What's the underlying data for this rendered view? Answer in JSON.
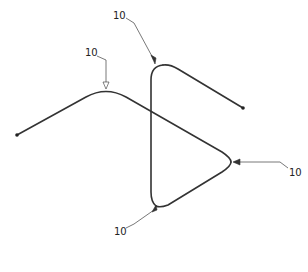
{
  "diagram": {
    "type": "patent line drawing",
    "colors": {
      "stroke": "#333333",
      "leader": "#555555",
      "background": "#ffffff"
    },
    "reference_labels": [
      {
        "id": "label-top",
        "text": "10"
      },
      {
        "id": "label-upper-left",
        "text": "10"
      },
      {
        "id": "label-right",
        "text": "10"
      },
      {
        "id": "label-bottom",
        "text": "10"
      }
    ]
  }
}
